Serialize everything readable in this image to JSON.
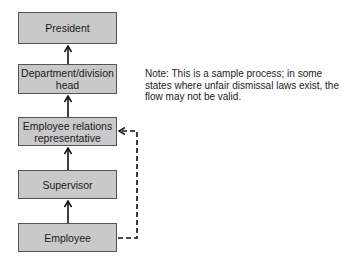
{
  "diagram": {
    "type": "flowchart",
    "nodes": [
      {
        "id": "president",
        "label": "President"
      },
      {
        "id": "dept-head",
        "label": "Department/division head"
      },
      {
        "id": "er-rep",
        "label": "Employee relations representative"
      },
      {
        "id": "supervisor",
        "label": "Supervisor"
      },
      {
        "id": "employee",
        "label": "Employee"
      }
    ],
    "edges": [
      {
        "from": "employee",
        "to": "supervisor",
        "style": "solid"
      },
      {
        "from": "supervisor",
        "to": "er-rep",
        "style": "solid"
      },
      {
        "from": "er-rep",
        "to": "dept-head",
        "style": "solid"
      },
      {
        "from": "dept-head",
        "to": "president",
        "style": "solid"
      },
      {
        "from": "employee",
        "to": "er-rep",
        "style": "dashed"
      }
    ],
    "note": "Note: This is a sample process; in some states where unfair dismissal laws exist, the flow may not be valid."
  }
}
